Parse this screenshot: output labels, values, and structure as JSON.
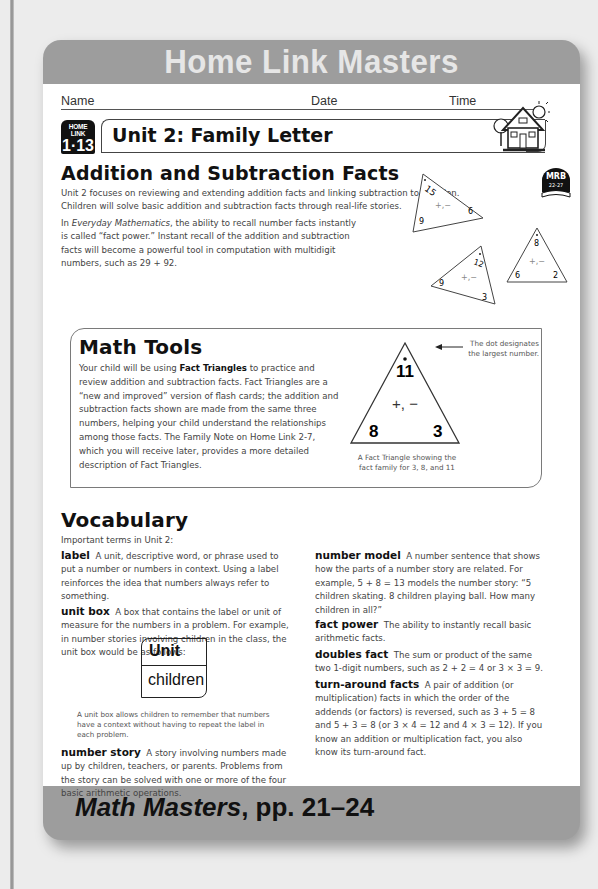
{
  "banner": {
    "title": "Home Link Masters"
  },
  "header_fields": {
    "name": "Name",
    "date": "Date",
    "time": "Time"
  },
  "home_link_badge": {
    "label": "HOME LINK",
    "number": "1·13"
  },
  "letter_title": "Unit 2: Family Letter",
  "icons": {
    "house": "house-icon",
    "mrb_badge": {
      "label": "MRB",
      "pages": "22-27"
    }
  },
  "addition_section": {
    "heading": "Addition and Subtraction Facts",
    "paragraph1": "Unit 2 focuses on reviewing and extending addition facts and linking subtraction to addition. Children will solve basic addition and subtraction facts through real-life stories.",
    "paragraph2_italic": "Everyday Mathematics",
    "paragraph2_pre": "In ",
    "paragraph2_post": ", the ability to recall number facts instantly is called “fact power.” Instant recall of the addition and subtraction facts will become a powerful tool in computation with multidigit numbers, such as 29 + 92."
  },
  "decor_triangles": [
    {
      "top": "15",
      "left": "9",
      "right": "6",
      "ops": "+,−"
    },
    {
      "top": "8",
      "left": "6",
      "right": "2",
      "ops": "+,−"
    },
    {
      "top": "12",
      "left": "9",
      "right": "3",
      "ops": "+,−"
    }
  ],
  "math_tools": {
    "heading": "Math Tools",
    "text_pre": "Your child will be using ",
    "text_bold": "Fact Triangles",
    "text_post": " to practice and review addition and subtraction facts. Fact Triangles are a “new and improved” version of flash cards; the addition and subtraction facts shown are made from the same three numbers, helping your child understand the relationships among those facts. The Family Note on Home Link 2-7, which you will receive later, provides a more detailed description of Fact Triangles.",
    "triangle": {
      "top": "11",
      "left": "8",
      "right": "3",
      "ops": "+, −"
    },
    "dot_note": "The dot designates the largest number.",
    "caption": "A Fact Triangle showing the fact family for 3, 8, and 11"
  },
  "vocabulary": {
    "heading": "Vocabulary",
    "intro": "Important terms in Unit 2:",
    "terms": [
      {
        "term": "label",
        "definition": "A unit, descriptive word, or phrase used to put a number or numbers in context. Using a label reinforces the idea that numbers always refer to something."
      },
      {
        "term": "unit box",
        "definition": "A box that contains the label or unit of measure for the numbers in a problem. For example, in number stories involving children in the class, the unit box would be as follows:"
      },
      {
        "term": "number story",
        "definition": "A story involving numbers made up by children, teachers, or parents. Problems from the story can be solved with one or more of the four basic arithmetic operations."
      },
      {
        "term": "number model",
        "definition": "A number sentence that shows how the parts of a number story are related. For example, 5 + 8 = 13 models the number story: “5 children skating. 8 children playing ball. How many children in all?”"
      },
      {
        "term": "fact power",
        "definition": "The ability to instantly recall basic arithmetic facts."
      },
      {
        "term": "doubles fact",
        "definition": "The sum or product of the same two 1-digit numbers, such as 2 + 2 = 4 or 3 × 3 = 9."
      },
      {
        "term": "turn-around facts",
        "definition": "A pair of addition (or multiplication) facts in which the order of the addends (or factors) is reversed, such as 3 + 5 = 8 and 5 + 3 = 8 (or 3 × 4 = 12 and 4 × 3 = 12). If you know an addition or multiplication fact, you also know its turn-around fact."
      }
    ],
    "unit_box": {
      "header": "Unit",
      "value": "children"
    },
    "unit_box_caption": "A unit box allows children to remember that numbers have a context without having to repeat the label in each problem."
  },
  "footer": {
    "title_italic": "Math Masters",
    "title_rest": ", pp. 21–24"
  }
}
